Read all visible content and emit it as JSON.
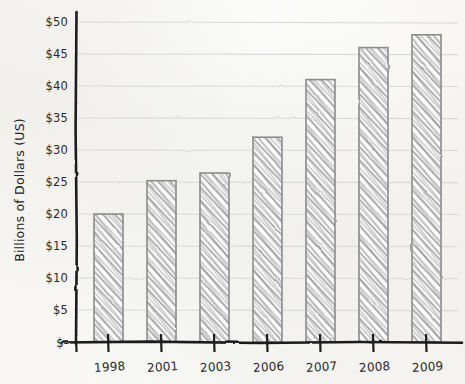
{
  "chart_data": {
    "type": "bar",
    "title": "",
    "xlabel": "",
    "ylabel": "Billions of Dollars (US)",
    "categories": [
      "1998",
      "2001",
      "2003",
      "2006",
      "2007",
      "2008",
      "2009"
    ],
    "values": [
      20,
      25.2,
      26.4,
      32,
      41,
      46,
      48
    ],
    "ylim": [
      0,
      50
    ],
    "ytick_values": [
      0,
      5,
      10,
      15,
      20,
      25,
      30,
      35,
      40,
      45,
      50
    ],
    "ytick_labels": [
      "$-",
      "$5",
      "$10",
      "$15",
      "$20",
      "$25",
      "$30",
      "$35",
      "$40",
      "$45",
      "$50"
    ],
    "grid": true,
    "grid_axis": "y",
    "legend": null,
    "style": "hand-drawn pencil sketch on paper",
    "bar_fill": "diagonal pencil hatching",
    "colors": {
      "bar_outline": "#8d8d8d",
      "bar_hatch": "#9a9a9a",
      "bar_face": "#ffffff",
      "gridline": "#d8d8d6",
      "axis": "#1c1c1c",
      "text": "#2a2a2a",
      "paper": "#fbfbf9"
    }
  },
  "axes": {
    "y_title": "Billions of Dollars (US)",
    "y_ticks": [
      {
        "label": "$50",
        "value": 50
      },
      {
        "label": "$45",
        "value": 45
      },
      {
        "label": "$40",
        "value": 40
      },
      {
        "label": "$35",
        "value": 35
      },
      {
        "label": "$30",
        "value": 30
      },
      {
        "label": "$25",
        "value": 25
      },
      {
        "label": "$20",
        "value": 20
      },
      {
        "label": "$15",
        "value": 15
      },
      {
        "label": "$10",
        "value": 10
      },
      {
        "label": "$5",
        "value": 5
      },
      {
        "label": "$-",
        "value": 0
      }
    ],
    "x_ticks": [
      {
        "label": "1998",
        "value": 20
      },
      {
        "label": "2001",
        "value": 25.2
      },
      {
        "label": "2003",
        "value": 26.4
      },
      {
        "label": "2006",
        "value": 32
      },
      {
        "label": "2007",
        "value": 41
      },
      {
        "label": "2008",
        "value": 46
      },
      {
        "label": "2009",
        "value": 48
      }
    ]
  }
}
